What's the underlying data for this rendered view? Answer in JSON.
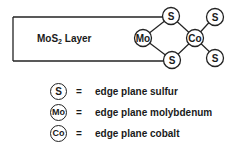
{
  "diagram": {
    "layer_label_main": "MoS",
    "layer_label_sub": "2",
    "layer_label_suffix": " Layer",
    "atoms": {
      "mo": "Mo",
      "s_top": "S",
      "s_bottom": "S",
      "co": "Co",
      "s_top_right": "S",
      "s_bottom_right": "S"
    }
  },
  "legend": {
    "items": [
      {
        "symbol": "S",
        "equals": "=",
        "description": "edge plane sulfur"
      },
      {
        "symbol": "Mo",
        "equals": "=",
        "description": "edge plane molybdenum"
      },
      {
        "symbol": "Co",
        "equals": "=",
        "description": "edge plane cobalt"
      }
    ]
  },
  "colors": {
    "line": "#222222",
    "background": "#ffffff"
  }
}
